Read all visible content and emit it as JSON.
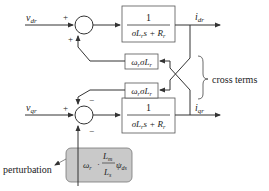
{
  "diagram": {
    "type": "block-diagram",
    "inputs": {
      "d": {
        "symbol": "v",
        "sub": "dr"
      },
      "q": {
        "symbol": "v",
        "sub": "qr"
      }
    },
    "outputs": {
      "d": {
        "symbol": "i",
        "sub": "dr"
      },
      "q": {
        "symbol": "i",
        "sub": "qr"
      }
    },
    "sum_d_signs": {
      "input": "+",
      "feedback": "+"
    },
    "sum_q_signs": {
      "input": "+",
      "feedback": "−",
      "perturbation": "−"
    },
    "transfer_function": {
      "numerator": "1",
      "den_sigma": "σ",
      "den_L": "L",
      "den_Lsub": "r",
      "den_s": "s + ",
      "den_R": "R",
      "den_Rsub": "r"
    },
    "cross_block": {
      "omega": "ω",
      "omega_sub": "r",
      "sigma": "σ",
      "L": "L",
      "L_sub": "r"
    },
    "perturbation_block": {
      "omega": "ω",
      "omega_sub": "r",
      "dot": "·",
      "num_L": "L",
      "num_sub": "m",
      "den_L": "L",
      "den_sub": "s",
      "psi": "ψ",
      "psi_sub": "ds",
      "fill": "#c8c8c8"
    },
    "labels": {
      "cross_terms": "cross terms",
      "perturbation": "perturbation"
    },
    "colors": {
      "line": "#333333",
      "box_fill": "#ffffff",
      "perturb_fill": "#c9c9c9"
    }
  }
}
